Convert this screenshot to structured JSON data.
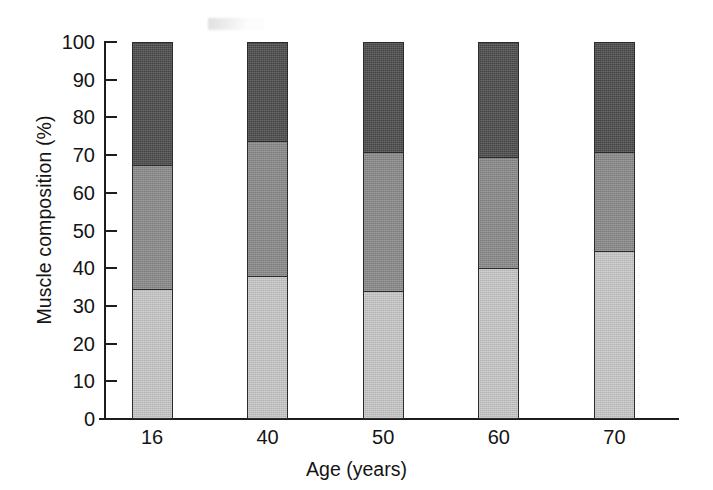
{
  "chart_data": {
    "type": "bar",
    "subtype": "stacked-bar",
    "title": "",
    "xlabel": "Age (years)",
    "ylabel": "Muscle composition (%)",
    "categories": [
      "16",
      "40",
      "50",
      "60",
      "70"
    ],
    "ylim": [
      0,
      100
    ],
    "ytick_labels": [
      "0",
      "10",
      "20",
      "30",
      "40",
      "50",
      "60",
      "70",
      "80",
      "90",
      "100"
    ],
    "ytick_values": [
      0,
      10,
      20,
      30,
      40,
      50,
      60,
      70,
      80,
      90,
      100
    ],
    "grid": false,
    "legend": "none",
    "stack_order": "bottom-to-top",
    "series": [
      {
        "name": "Type I (dark grey, bottom segment)",
        "color": "#4c4c4c",
        "values": [
          34.5,
          38.0,
          34.0,
          40.0,
          44.5
        ]
      },
      {
        "name": "Type IIa (medium grey, middle segment)",
        "color": "#8b8b8b",
        "values": [
          33.0,
          36.0,
          37.0,
          29.5,
          26.5
        ]
      },
      {
        "name": "Type IIb (light grey, top segment)",
        "color": "#c9c9c9",
        "values": [
          32.5,
          26.0,
          29.0,
          30.5,
          29.0
        ]
      }
    ],
    "cumulative_tops": [
      [
        34.5,
        67.5,
        100.0
      ],
      [
        38.0,
        74.0,
        100.0
      ],
      [
        34.0,
        71.0,
        100.0
      ],
      [
        40.0,
        69.5,
        100.0
      ],
      [
        44.5,
        71.0,
        100.0
      ]
    ]
  }
}
